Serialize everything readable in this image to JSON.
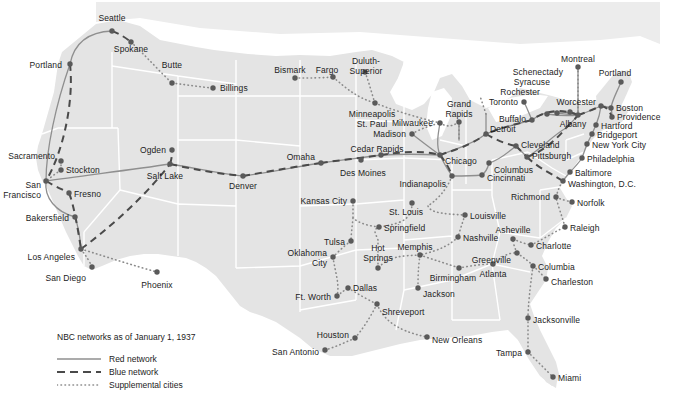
{
  "map": {
    "title": "NBC networks as of January 1, 1937",
    "colors": {
      "land": "#e4e4e4",
      "border": "#ffffff",
      "water": "#ffffff",
      "line": "#8c8c8c",
      "dot": "#5a5a5a",
      "text": "#1c1c1c"
    },
    "legend": [
      {
        "name": "red-network",
        "label": "Red network",
        "style": "solid"
      },
      {
        "name": "blue-network",
        "label": "Blue network",
        "style": "dashed"
      },
      {
        "name": "supplemental-cities",
        "label": "Supplemental cities",
        "style": "dotted"
      }
    ],
    "cities": [
      {
        "id": "seattle",
        "label": "Seattle",
        "x": 112,
        "y": 31,
        "lx": 112,
        "ly": 14,
        "align": "c"
      },
      {
        "id": "spokane",
        "label": "Spokane",
        "x": 131,
        "y": 42,
        "lx": 131,
        "ly": 45,
        "align": "c"
      },
      {
        "id": "portland-or",
        "label": "Portland",
        "x": 70,
        "y": 64,
        "lx": 62,
        "ly": 61,
        "align": "r"
      },
      {
        "id": "butte",
        "label": "Butte",
        "x": 172,
        "y": 83,
        "lx": 172,
        "ly": 61,
        "align": "c"
      },
      {
        "id": "billings",
        "label": "Billings",
        "x": 213,
        "y": 88,
        "lx": 220,
        "ly": 84,
        "align": "l"
      },
      {
        "id": "bismark",
        "label": "Bismark",
        "x": 295,
        "y": 78,
        "lx": 290,
        "ly": 66,
        "align": "c"
      },
      {
        "id": "fargo",
        "label": "Fargo",
        "x": 333,
        "y": 77,
        "lx": 327,
        "ly": 66,
        "align": "c"
      },
      {
        "id": "duluth",
        "label": "Duluth-\nSuperior",
        "x": 365,
        "y": 72,
        "lx": 366,
        "ly": 57,
        "align": "c"
      },
      {
        "id": "minneapolis",
        "label": "Minneapolis\nSt. Paul",
        "x": 375,
        "y": 103,
        "lx": 372,
        "ly": 110,
        "align": "c"
      },
      {
        "id": "madison",
        "label": "Madison",
        "x": 412,
        "y": 134,
        "lx": 406,
        "ly": 130,
        "align": "r"
      },
      {
        "id": "milwaukee",
        "label": "Milwaukee",
        "x": 440,
        "y": 123,
        "lx": 433,
        "ly": 119,
        "align": "r"
      },
      {
        "id": "grand-rapids",
        "label": "Grand\nRapids",
        "x": 459,
        "y": 122,
        "lx": 459,
        "ly": 100,
        "align": "c"
      },
      {
        "id": "detroit",
        "label": "Detroit",
        "x": 486,
        "y": 134,
        "lx": 490,
        "ly": 125,
        "align": "l"
      },
      {
        "id": "toronto",
        "label": "Toronto",
        "x": 524,
        "y": 102,
        "lx": 518,
        "ly": 98,
        "align": "r"
      },
      {
        "id": "buffalo",
        "label": "Buffalo",
        "x": 532,
        "y": 120,
        "lx": 526,
        "ly": 115,
        "align": "r"
      },
      {
        "id": "rochester",
        "label": "Rochester",
        "x": 547,
        "y": 114,
        "lx": 540,
        "ly": 88,
        "align": "r"
      },
      {
        "id": "syracuse",
        "label": "Syracuse",
        "x": 557,
        "y": 113,
        "lx": 550,
        "ly": 78,
        "align": "r"
      },
      {
        "id": "schenectady",
        "label": "Schenectady",
        "x": 570,
        "y": 112,
        "lx": 563,
        "ly": 68,
        "align": "r"
      },
      {
        "id": "albany",
        "label": "Albany",
        "x": 578,
        "y": 115,
        "lx": 573,
        "ly": 120,
        "align": "c"
      },
      {
        "id": "montreal",
        "label": "Montreal",
        "x": 578,
        "y": 67,
        "lx": 578,
        "ly": 55,
        "align": "c"
      },
      {
        "id": "portland-me",
        "label": "Portland",
        "x": 621,
        "y": 82,
        "lx": 615,
        "ly": 69,
        "align": "c"
      },
      {
        "id": "worcester",
        "label": "Worcester",
        "x": 601,
        "y": 106,
        "lx": 596,
        "ly": 98,
        "align": "r"
      },
      {
        "id": "boston",
        "label": "Boston",
        "x": 611,
        "y": 108,
        "lx": 616,
        "ly": 104,
        "align": "l"
      },
      {
        "id": "providence",
        "label": "Providence",
        "x": 612,
        "y": 117,
        "lx": 617,
        "ly": 113,
        "align": "l"
      },
      {
        "id": "hartford",
        "label": "Hartford",
        "x": 596,
        "y": 125,
        "lx": 601,
        "ly": 122,
        "align": "l"
      },
      {
        "id": "bridgeport",
        "label": "Bridgeport",
        "x": 592,
        "y": 134,
        "lx": 597,
        "ly": 131,
        "align": "l"
      },
      {
        "id": "new-york",
        "label": "New York City",
        "x": 587,
        "y": 144,
        "lx": 592,
        "ly": 141,
        "align": "l"
      },
      {
        "id": "philadelphia",
        "label": "Philadelphia",
        "x": 582,
        "y": 158,
        "lx": 587,
        "ly": 155,
        "align": "l"
      },
      {
        "id": "baltimore",
        "label": "Baltimore",
        "x": 570,
        "y": 172,
        "lx": 575,
        "ly": 169,
        "align": "l"
      },
      {
        "id": "washington",
        "label": "Washington, D.C.",
        "x": 563,
        "y": 181,
        "lx": 568,
        "ly": 180,
        "align": "l"
      },
      {
        "id": "richmond",
        "label": "Richmond",
        "x": 556,
        "y": 197,
        "lx": 550,
        "ly": 193,
        "align": "r"
      },
      {
        "id": "norfolk",
        "label": "Norfolk",
        "x": 572,
        "y": 202,
        "lx": 577,
        "ly": 199,
        "align": "l"
      },
      {
        "id": "raleigh",
        "label": "Raleigh",
        "x": 565,
        "y": 227,
        "lx": 570,
        "ly": 224,
        "align": "l"
      },
      {
        "id": "charlotte",
        "label": "Charlotte",
        "x": 531,
        "y": 245,
        "lx": 536,
        "ly": 242,
        "align": "l"
      },
      {
        "id": "asheville",
        "label": "Asheville",
        "x": 513,
        "y": 239,
        "lx": 513,
        "ly": 226,
        "align": "c"
      },
      {
        "id": "greenville",
        "label": "Greenville",
        "x": 517,
        "y": 253,
        "lx": 511,
        "ly": 256,
        "align": "r"
      },
      {
        "id": "columbia",
        "label": "Columbia",
        "x": 533,
        "y": 266,
        "lx": 538,
        "ly": 263,
        "align": "l"
      },
      {
        "id": "charleston",
        "label": "Charleston",
        "x": 546,
        "y": 279,
        "lx": 551,
        "ly": 278,
        "align": "l"
      },
      {
        "id": "atlanta",
        "label": "Atlanta",
        "x": 493,
        "y": 264,
        "lx": 493,
        "ly": 270,
        "align": "c"
      },
      {
        "id": "jacksonville",
        "label": "Jacksonville",
        "x": 528,
        "y": 318,
        "lx": 533,
        "ly": 316,
        "align": "l"
      },
      {
        "id": "tampa",
        "label": "Tampa",
        "x": 528,
        "y": 352,
        "lx": 522,
        "ly": 349,
        "align": "r"
      },
      {
        "id": "miami",
        "label": "Miami",
        "x": 553,
        "y": 377,
        "lx": 558,
        "ly": 374,
        "align": "l"
      },
      {
        "id": "birmingham",
        "label": "Birmingham",
        "x": 459,
        "y": 268,
        "lx": 453,
        "ly": 274,
        "align": "c"
      },
      {
        "id": "jackson",
        "label": "Jackson",
        "x": 418,
        "y": 288,
        "lx": 423,
        "ly": 290,
        "align": "l"
      },
      {
        "id": "new-orleans",
        "label": "New Orleans",
        "x": 427,
        "y": 337,
        "lx": 432,
        "ly": 336,
        "align": "l"
      },
      {
        "id": "nashville",
        "label": "Nashville",
        "x": 458,
        "y": 237,
        "lx": 463,
        "ly": 234,
        "align": "l"
      },
      {
        "id": "louisville",
        "label": "Louisville",
        "x": 465,
        "y": 215,
        "lx": 470,
        "ly": 212,
        "align": "l"
      },
      {
        "id": "cincinnati",
        "label": "Cincinnati",
        "x": 482,
        "y": 175,
        "lx": 487,
        "ly": 174,
        "align": "l"
      },
      {
        "id": "columbus",
        "label": "Columbus",
        "x": 489,
        "y": 163,
        "lx": 494,
        "ly": 166,
        "align": "l"
      },
      {
        "id": "indianapolis",
        "label": "Indianapolis",
        "x": 452,
        "y": 176,
        "lx": 446,
        "ly": 180,
        "align": "r"
      },
      {
        "id": "chicago",
        "label": "Chicago",
        "x": 440,
        "y": 155,
        "lx": 445,
        "ly": 157,
        "align": "l"
      },
      {
        "id": "cleveland",
        "label": "Cleveland",
        "x": 516,
        "y": 146,
        "lx": 521,
        "ly": 141,
        "align": "l"
      },
      {
        "id": "pittsburgh",
        "label": "Pittsburgh",
        "x": 527,
        "y": 157,
        "lx": 532,
        "ly": 152,
        "align": "l"
      },
      {
        "id": "cedar-rapids",
        "label": "Cedar Rapids",
        "x": 381,
        "y": 155,
        "lx": 377,
        "ly": 145,
        "align": "c"
      },
      {
        "id": "des-moines",
        "label": "Des Moines",
        "x": 361,
        "y": 160,
        "lx": 363,
        "ly": 169,
        "align": "c"
      },
      {
        "id": "omaha",
        "label": "Omaha",
        "x": 321,
        "y": 163,
        "lx": 315,
        "ly": 153,
        "align": "r"
      },
      {
        "id": "kansas-city",
        "label": "Kansas City",
        "x": 353,
        "y": 201,
        "lx": 347,
        "ly": 197,
        "align": "r"
      },
      {
        "id": "st-louis",
        "label": "St. Louis",
        "x": 412,
        "y": 203,
        "lx": 406,
        "ly": 208,
        "align": "c"
      },
      {
        "id": "springfield",
        "label": "Springfield",
        "x": 379,
        "y": 227,
        "lx": 384,
        "ly": 224,
        "align": "l"
      },
      {
        "id": "tulsa",
        "label": "Tulsa",
        "x": 351,
        "y": 241,
        "lx": 345,
        "ly": 238,
        "align": "r"
      },
      {
        "id": "oklahoma-city",
        "label": "Oklahoma\nCity",
        "x": 333,
        "y": 257,
        "lx": 327,
        "ly": 249,
        "align": "r"
      },
      {
        "id": "hot-springs",
        "label": "Hot\nSprings",
        "x": 378,
        "y": 268,
        "lx": 378,
        "ly": 244,
        "align": "c"
      },
      {
        "id": "memphis",
        "label": "Memphis",
        "x": 420,
        "y": 255,
        "lx": 415,
        "ly": 243,
        "align": "c"
      },
      {
        "id": "dallas",
        "label": "Dallas",
        "x": 348,
        "y": 288,
        "lx": 353,
        "ly": 284,
        "align": "l"
      },
      {
        "id": "ft-worth",
        "label": "Ft. Worth",
        "x": 337,
        "y": 296,
        "lx": 331,
        "ly": 293,
        "align": "r"
      },
      {
        "id": "shreveport",
        "label": "Shreveport",
        "x": 377,
        "y": 304,
        "lx": 382,
        "ly": 308,
        "align": "l"
      },
      {
        "id": "houston",
        "label": "Houston",
        "x": 355,
        "y": 338,
        "lx": 349,
        "ly": 331,
        "align": "r"
      },
      {
        "id": "san-antonio",
        "label": "San Antonio",
        "x": 325,
        "y": 350,
        "lx": 319,
        "ly": 348,
        "align": "r"
      },
      {
        "id": "denver",
        "label": "Denver",
        "x": 243,
        "y": 176,
        "lx": 243,
        "ly": 182,
        "align": "c"
      },
      {
        "id": "salt-lake",
        "label": "Salt Lake",
        "x": 170,
        "y": 164,
        "lx": 165,
        "ly": 172,
        "align": "c"
      },
      {
        "id": "ogden",
        "label": "Ogden",
        "x": 172,
        "y": 150,
        "lx": 166,
        "ly": 146,
        "align": "r"
      },
      {
        "id": "sacramento",
        "label": "Sacramento",
        "x": 61,
        "y": 161,
        "lx": 55,
        "ly": 152,
        "align": "r"
      },
      {
        "id": "stockton",
        "label": "Stockton",
        "x": 61,
        "y": 170,
        "lx": 66,
        "ly": 166,
        "align": "l"
      },
      {
        "id": "san-francisco",
        "label": "San\nFrancisco",
        "x": 46,
        "y": 181,
        "lx": 41,
        "ly": 181,
        "align": "r"
      },
      {
        "id": "fresno",
        "label": "Fresno",
        "x": 69,
        "y": 193,
        "lx": 74,
        "ly": 190,
        "align": "l"
      },
      {
        "id": "bakersfield",
        "label": "Bakersfield",
        "x": 75,
        "y": 217,
        "lx": 69,
        "ly": 214,
        "align": "r"
      },
      {
        "id": "los-angeles",
        "label": "Los Angeles",
        "x": 81,
        "y": 249,
        "lx": 75,
        "ly": 253,
        "align": "r"
      },
      {
        "id": "san-diego",
        "label": "San Diego",
        "x": 92,
        "y": 267,
        "lx": 86,
        "ly": 274,
        "align": "r"
      },
      {
        "id": "phoenix",
        "label": "Phoenix",
        "x": 157,
        "y": 272,
        "lx": 157,
        "ly": 281,
        "align": "c"
      }
    ]
  }
}
